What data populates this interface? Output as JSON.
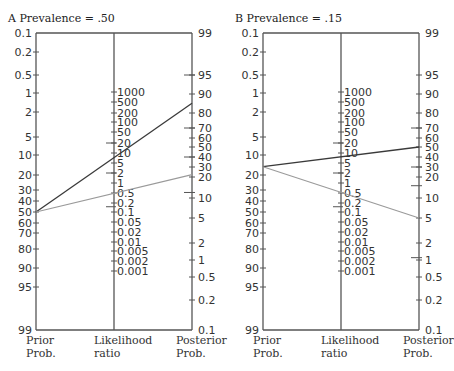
{
  "chart_data": [
    {
      "type": "line",
      "panel": "A",
      "title": "Prevalence = .50",
      "panel_label": "A",
      "axes": {
        "prior": {
          "label": [
            "Prior",
            "Prob."
          ],
          "ticks": [
            "0.1",
            "0.2",
            "0.5",
            "1",
            "2",
            "5",
            "10",
            "20",
            "30",
            "40",
            "50",
            "60",
            "70",
            "80",
            "90",
            "95",
            "99"
          ]
        },
        "likelihood": {
          "label": [
            "Likelihood",
            "ratio"
          ],
          "ticks": [
            "1000",
            "500",
            "200",
            "100",
            "50",
            "20",
            "10",
            "5",
            "2",
            "1",
            "0.5",
            "0.2",
            "0.1",
            "0.05",
            "0.02",
            "0.01",
            "0.005",
            "0.002",
            "0.001"
          ]
        },
        "posterior": {
          "label": [
            "Posterior",
            "Prob."
          ],
          "ticks": [
            "99",
            "95",
            "90",
            "80",
            "70",
            "60",
            "50",
            "40",
            "30",
            "20",
            "10",
            "5",
            "2",
            "1",
            "0.5",
            "0.2",
            "0.1"
          ]
        }
      },
      "series": [
        {
          "name": "positive test",
          "color": "#3a3a3a",
          "prior": 50,
          "likelihood_ratio": 6,
          "posterior": 85
        },
        {
          "name": "negative test",
          "color": "#9a9a9a",
          "prior": 50,
          "likelihood_ratio": 0.3,
          "posterior": 22
        }
      ],
      "markers_posterior": [
        95,
        70,
        40,
        12
      ],
      "markers_likelihood": [
        20,
        2,
        0.15
      ]
    },
    {
      "type": "line",
      "panel": "B",
      "title": "Prevalence = .15",
      "panel_label": "B",
      "axes": {
        "prior": {
          "label": [
            "Prior",
            "Prob."
          ],
          "ticks": [
            "0.1",
            "0.2",
            "0.5",
            "1",
            "2",
            "5",
            "10",
            "20",
            "30",
            "40",
            "50",
            "60",
            "70",
            "80",
            "90",
            "95",
            "99"
          ]
        },
        "likelihood": {
          "label": [
            "Likelihood",
            "ratio"
          ],
          "ticks": [
            "1000",
            "500",
            "200",
            "100",
            "50",
            "20",
            "10",
            "5",
            "2",
            "1",
            "0.5",
            "0.2",
            "0.1",
            "0.05",
            "0.02",
            "0.01",
            "0.005",
            "0.002",
            "0.001"
          ]
        },
        "posterior": {
          "label": [
            "Posterior",
            "Prob."
          ],
          "ticks": [
            "99",
            "95",
            "90",
            "80",
            "70",
            "60",
            "50",
            "40",
            "30",
            "20",
            "10",
            "5",
            "2",
            "1",
            "0.5",
            "0.2",
            "0.1"
          ]
        }
      },
      "series": [
        {
          "name": "positive test",
          "color": "#3a3a3a",
          "prior": 15,
          "likelihood_ratio": 6,
          "posterior": 50
        },
        {
          "name": "negative test",
          "color": "#9a9a9a",
          "prior": 15,
          "likelihood_ratio": 0.3,
          "posterior": 5
        }
      ],
      "markers_posterior": [
        70,
        30,
        15,
        1.1
      ],
      "markers_likelihood": [
        20,
        2,
        0.15
      ]
    }
  ],
  "panels": [
    {
      "label": "A",
      "title": "Prevalence = .50"
    },
    {
      "label": "B",
      "title": "Prevalence = .15"
    }
  ],
  "axis_names": {
    "prior_1": "Prior",
    "prior_2": "Prob.",
    "lr_1": "Likelihood",
    "lr_2": "ratio",
    "post_1": "Posterior",
    "post_2": "Prob."
  }
}
